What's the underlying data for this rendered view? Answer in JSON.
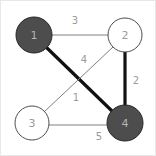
{
  "diagram": {
    "type": "weighted-undirected-graph",
    "title": "",
    "canvas": {
      "width": 156,
      "height": 156
    },
    "colors": {
      "node_fill_selected": "#4d4d4d",
      "node_fill_unselected": "#ffffff",
      "node_stroke": "#4d4d4d",
      "node_label_on_dark": "#b3b3b3",
      "node_label_on_light": "#9a9a9a",
      "edge_normal": "#808080",
      "edge_highlight": "#111111",
      "edge_weight_text": "#9a9a9a",
      "background": "#ffffff",
      "border": "#e8e8e8"
    },
    "nodes": [
      {
        "id": "1",
        "label": "1",
        "cx": 33,
        "cy": 34,
        "r": 18,
        "filled": true
      },
      {
        "id": "2",
        "label": "2",
        "cx": 124,
        "cy": 34,
        "r": 17,
        "filled": false
      },
      {
        "id": "3",
        "label": "3",
        "cx": 31,
        "cy": 122,
        "r": 17,
        "filled": false
      },
      {
        "id": "4",
        "label": "4",
        "cx": 124,
        "cy": 122,
        "r": 18,
        "filled": true
      }
    ],
    "edges": [
      {
        "id": "edge-1-2",
        "from": "1",
        "to": "2",
        "weight": "3",
        "highlighted": false,
        "x1": 51,
        "y1": 34,
        "x2": 107,
        "y2": 34,
        "label_x": 74,
        "label_y": 19
      },
      {
        "id": "edge-1-4",
        "from": "1",
        "to": "4",
        "weight": "1",
        "highlighted": true,
        "x1": 46,
        "y1": 47,
        "x2": 111,
        "y2": 110,
        "label_x": 75,
        "label_y": 96
      },
      {
        "id": "edge-2-3",
        "from": "2",
        "to": "3",
        "weight": "4",
        "highlighted": false,
        "x1": 112,
        "y1": 46,
        "x2": 43,
        "y2": 111,
        "label_x": 83,
        "label_y": 58
      },
      {
        "id": "edge-2-4",
        "from": "2",
        "to": "4",
        "weight": "2",
        "highlighted": true,
        "x1": 124,
        "y1": 51,
        "x2": 124,
        "y2": 104,
        "label_x": 135,
        "label_y": 79
      },
      {
        "id": "edge-3-4",
        "from": "3",
        "to": "4",
        "weight": "5",
        "highlighted": false,
        "x1": 48,
        "y1": 124,
        "x2": 106,
        "y2": 124,
        "label_x": 98,
        "label_y": 135
      }
    ]
  }
}
